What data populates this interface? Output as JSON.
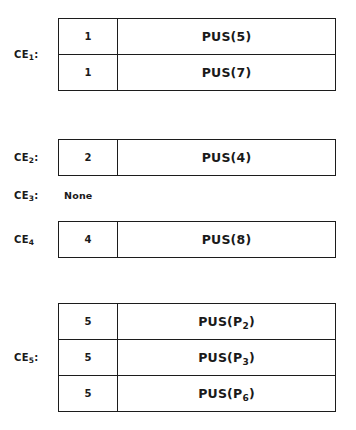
{
  "figure": {
    "groups": [
      {
        "id": "ce1",
        "label_base": "CE",
        "label_sub": "1",
        "label_suffix": ":",
        "has_table": true,
        "rows": [
          {
            "num": "1",
            "pus_prefix": "PUS(",
            "pus_arg": "5",
            "pus_arg_sub": "",
            "pus_suffix": ")"
          },
          {
            "num": "1",
            "pus_prefix": "PUS(",
            "pus_arg": "7",
            "pus_arg_sub": "",
            "pus_suffix": ")"
          }
        ]
      },
      {
        "id": "ce2",
        "label_base": "CE",
        "label_sub": "2",
        "label_suffix": ":",
        "has_table": true,
        "rows": [
          {
            "num": "2",
            "pus_prefix": "PUS(",
            "pus_arg": "4",
            "pus_arg_sub": "",
            "pus_suffix": ")"
          }
        ]
      },
      {
        "id": "ce3",
        "label_base": "CE",
        "label_sub": "3",
        "label_suffix": ":",
        "has_table": false,
        "none_text": "None",
        "rows": []
      },
      {
        "id": "ce4",
        "label_base": "CE",
        "label_sub": "4",
        "label_suffix": "",
        "has_table": true,
        "rows": [
          {
            "num": "4",
            "pus_prefix": "PUS(",
            "pus_arg": "8",
            "pus_arg_sub": "",
            "pus_suffix": ")"
          }
        ]
      },
      {
        "id": "ce5",
        "label_base": "CE",
        "label_sub": "5",
        "label_suffix": ":",
        "has_table": true,
        "rows": [
          {
            "num": "5",
            "pus_prefix": "PUS(",
            "pus_arg": "P",
            "pus_arg_sub": "2",
            "pus_suffix": ")"
          },
          {
            "num": "5",
            "pus_prefix": "PUS(",
            "pus_arg": "P",
            "pus_arg_sub": "3",
            "pus_suffix": ")"
          },
          {
            "num": "5",
            "pus_prefix": "PUS(",
            "pus_arg": "P",
            "pus_arg_sub": "6",
            "pus_suffix": ")"
          }
        ]
      }
    ],
    "colors": {
      "background": "#ffffff",
      "ink": "#1a1a1a",
      "border": "#1c1c1c"
    }
  }
}
